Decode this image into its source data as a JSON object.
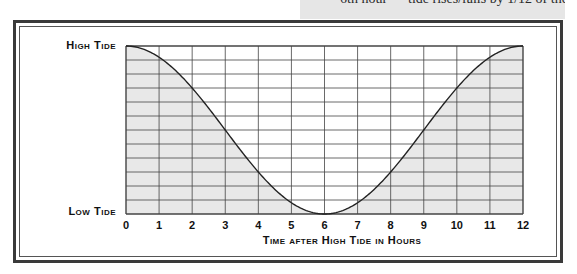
{
  "caption": {
    "text": "6th hour — tide rises/falls by 1/12 of the range"
  },
  "colors": {
    "fill": "#e8e8e8",
    "grid": "#444444",
    "curve": "#222222",
    "frame": "#3a3a3a",
    "caption_bg": "#e6e6e6"
  },
  "chart_data": {
    "type": "area",
    "title": "",
    "xlabel": "Time after High Tide in Hours",
    "ylabel": "",
    "x": [
      0,
      1,
      2,
      3,
      4,
      5,
      6,
      7,
      8,
      9,
      10,
      11,
      12
    ],
    "xticks": [
      "0",
      "1",
      "2",
      "3",
      "4",
      "5",
      "6",
      "7",
      "8",
      "9",
      "10",
      "11",
      "12"
    ],
    "y_labels": {
      "top": "High Tide",
      "bottom": "Low Tide"
    },
    "y_divisions": 12,
    "xlim": [
      0,
      12
    ],
    "ylim": [
      0,
      12
    ],
    "series": [
      {
        "name": "Tide level (twelfths of range above low tide)",
        "values": [
          12,
          11,
          9,
          6,
          3,
          1,
          0,
          1,
          3,
          6,
          9,
          11,
          12
        ]
      }
    ],
    "grid": true,
    "fill_under_curve": true,
    "legend": "none"
  },
  "axis": {
    "x_title": "Time after High Tide in Hours",
    "high_label": "High Tide",
    "low_label": "Low Tide"
  }
}
